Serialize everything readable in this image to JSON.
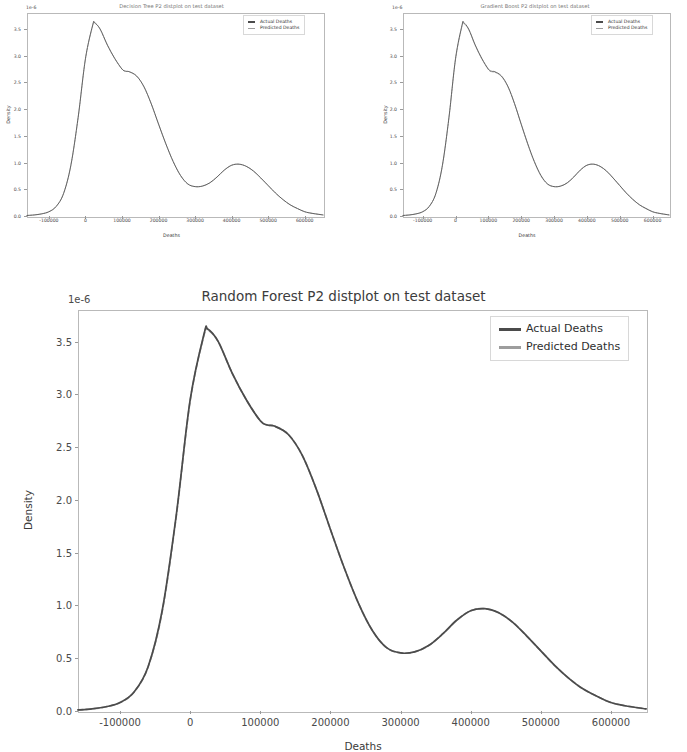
{
  "figure": {
    "background": "#ffffff",
    "panel_count": 3
  },
  "colors": {
    "actual": "#4b4b4b",
    "predicted": "#9d9d9d",
    "axis": "#b9b9b9",
    "text": "#3a3a3a"
  },
  "panels": [
    {
      "id": "decision-tree",
      "title": "Decision Tree P2 distplot on test dataset",
      "offset_text": "1e-6",
      "xlabel": "Deaths",
      "ylabel": "Density",
      "legend": [
        {
          "label": "Actual Deaths",
          "style": "solid"
        },
        {
          "label": "Predicted Deaths",
          "style": "dashed"
        }
      ]
    },
    {
      "id": "gradient-boost",
      "title": "Gradient Boost P2 distplot on test dataset",
      "offset_text": "1e-6",
      "xlabel": "Deaths",
      "ylabel": "Density",
      "legend": [
        {
          "label": "Actual Deaths",
          "style": "solid"
        },
        {
          "label": "Predicted Deaths",
          "style": "dashed"
        }
      ]
    },
    {
      "id": "random-forest",
      "title": "Random Forest P2 distplot on test dataset",
      "offset_text": "1e-6",
      "xlabel": "Deaths",
      "ylabel": "Density",
      "legend": [
        {
          "label": "Actual Deaths",
          "style": "solid"
        },
        {
          "label": "Predicted Deaths",
          "style": "dashed"
        }
      ]
    }
  ],
  "chart_data": [
    {
      "type": "line",
      "id": "decision-tree",
      "title": "Decision Tree P2 distplot on test dataset",
      "xlabel": "Deaths",
      "ylabel": "Density",
      "y_offset_text": "1e-6",
      "y_scale": 1e-06,
      "grid": false,
      "legend_position": "upper right",
      "xlim": [
        -160000,
        650000
      ],
      "ylim": [
        0.0,
        3.8
      ],
      "xticks": [
        -100000,
        0,
        100000,
        200000,
        300000,
        400000,
        500000,
        600000
      ],
      "xtick_labels": [
        "-100000",
        "0",
        "100000",
        "200000",
        "300000",
        "400000",
        "500000",
        "600000"
      ],
      "yticks": [
        0.0,
        0.5,
        1.0,
        1.5,
        2.0,
        2.5,
        3.0,
        3.5
      ],
      "ytick_labels": [
        "0.0",
        "0.5",
        "1.0",
        "1.5",
        "2.0",
        "2.5",
        "3.0",
        "3.5"
      ],
      "x": [
        -160000,
        -140000,
        -120000,
        -100000,
        -80000,
        -60000,
        -40000,
        -20000,
        0,
        20000,
        25000,
        40000,
        60000,
        80000,
        100000,
        110000,
        120000,
        140000,
        160000,
        180000,
        200000,
        220000,
        240000,
        260000,
        280000,
        300000,
        320000,
        340000,
        360000,
        380000,
        400000,
        420000,
        440000,
        460000,
        480000,
        500000,
        520000,
        540000,
        560000,
        580000,
        600000,
        620000,
        650000
      ],
      "series": [
        {
          "name": "Actual Deaths",
          "values": [
            0.01,
            0.02,
            0.04,
            0.08,
            0.18,
            0.42,
            0.95,
            1.85,
            2.95,
            3.58,
            3.62,
            3.5,
            3.2,
            2.95,
            2.75,
            2.71,
            2.7,
            2.62,
            2.42,
            2.1,
            1.72,
            1.35,
            1.02,
            0.76,
            0.6,
            0.55,
            0.56,
            0.62,
            0.73,
            0.86,
            0.95,
            0.97,
            0.93,
            0.84,
            0.71,
            0.57,
            0.43,
            0.31,
            0.21,
            0.14,
            0.08,
            0.05,
            0.02
          ]
        },
        {
          "name": "Predicted Deaths",
          "values": [
            0.01,
            0.02,
            0.04,
            0.08,
            0.18,
            0.42,
            0.94,
            1.84,
            2.94,
            3.57,
            3.61,
            3.5,
            3.2,
            2.95,
            2.75,
            2.71,
            2.7,
            2.62,
            2.42,
            2.1,
            1.72,
            1.35,
            1.02,
            0.76,
            0.6,
            0.55,
            0.56,
            0.62,
            0.73,
            0.86,
            0.95,
            0.97,
            0.93,
            0.84,
            0.71,
            0.57,
            0.43,
            0.31,
            0.21,
            0.14,
            0.08,
            0.05,
            0.02
          ]
        }
      ]
    },
    {
      "type": "line",
      "id": "gradient-boost",
      "title": "Gradient Boost P2 distplot on test dataset",
      "xlabel": "Deaths",
      "ylabel": "Density",
      "y_offset_text": "1e-6",
      "y_scale": 1e-06,
      "grid": false,
      "legend_position": "upper right",
      "xlim": [
        -160000,
        650000
      ],
      "ylim": [
        0.0,
        3.8
      ],
      "xticks": [
        -100000,
        0,
        100000,
        200000,
        300000,
        400000,
        500000,
        600000
      ],
      "xtick_labels": [
        "-100000",
        "0",
        "100000",
        "200000",
        "300000",
        "400000",
        "500000",
        "600000"
      ],
      "yticks": [
        0.0,
        0.5,
        1.0,
        1.5,
        2.0,
        2.5,
        3.0,
        3.5
      ],
      "ytick_labels": [
        "0.0",
        "0.5",
        "1.0",
        "1.5",
        "2.0",
        "2.5",
        "3.0",
        "3.5"
      ],
      "x": [
        -160000,
        -140000,
        -120000,
        -100000,
        -80000,
        -60000,
        -40000,
        -20000,
        0,
        20000,
        25000,
        40000,
        60000,
        80000,
        100000,
        110000,
        120000,
        140000,
        160000,
        180000,
        200000,
        220000,
        240000,
        260000,
        280000,
        300000,
        320000,
        340000,
        360000,
        380000,
        400000,
        420000,
        440000,
        460000,
        480000,
        500000,
        520000,
        540000,
        560000,
        580000,
        600000,
        620000,
        650000
      ],
      "series": [
        {
          "name": "Actual Deaths",
          "values": [
            0.01,
            0.02,
            0.04,
            0.08,
            0.18,
            0.42,
            0.95,
            1.85,
            2.95,
            3.58,
            3.62,
            3.5,
            3.2,
            2.95,
            2.75,
            2.71,
            2.7,
            2.62,
            2.42,
            2.1,
            1.72,
            1.35,
            1.02,
            0.76,
            0.6,
            0.55,
            0.56,
            0.62,
            0.73,
            0.86,
            0.95,
            0.97,
            0.93,
            0.84,
            0.71,
            0.57,
            0.43,
            0.31,
            0.21,
            0.14,
            0.08,
            0.05,
            0.02
          ]
        },
        {
          "name": "Predicted Deaths",
          "values": [
            0.01,
            0.02,
            0.04,
            0.08,
            0.18,
            0.42,
            0.94,
            1.84,
            2.93,
            3.56,
            3.6,
            3.49,
            3.19,
            2.94,
            2.74,
            2.7,
            2.69,
            2.61,
            2.41,
            2.09,
            1.71,
            1.34,
            1.01,
            0.75,
            0.6,
            0.55,
            0.56,
            0.62,
            0.73,
            0.86,
            0.95,
            0.97,
            0.93,
            0.84,
            0.71,
            0.57,
            0.43,
            0.31,
            0.21,
            0.14,
            0.08,
            0.05,
            0.02
          ]
        }
      ]
    },
    {
      "type": "line",
      "id": "random-forest",
      "title": "Random Forest P2 distplot on test dataset",
      "xlabel": "Deaths",
      "ylabel": "Density",
      "y_offset_text": "1e-6",
      "y_scale": 1e-06,
      "grid": false,
      "legend_position": "upper right",
      "xlim": [
        -160000,
        650000
      ],
      "ylim": [
        0.0,
        3.8
      ],
      "xticks": [
        -100000,
        0,
        100000,
        200000,
        300000,
        400000,
        500000,
        600000
      ],
      "xtick_labels": [
        "-100000",
        "0",
        "100000",
        "200000",
        "300000",
        "400000",
        "500000",
        "600000"
      ],
      "yticks": [
        0.0,
        0.5,
        1.0,
        1.5,
        2.0,
        2.5,
        3.0,
        3.5
      ],
      "ytick_labels": [
        "0.0",
        "0.5",
        "1.0",
        "1.5",
        "2.0",
        "2.5",
        "3.0",
        "3.5"
      ],
      "x": [
        -160000,
        -140000,
        -120000,
        -100000,
        -80000,
        -60000,
        -40000,
        -20000,
        0,
        20000,
        25000,
        40000,
        60000,
        80000,
        100000,
        110000,
        120000,
        140000,
        160000,
        180000,
        200000,
        220000,
        240000,
        260000,
        280000,
        300000,
        320000,
        340000,
        360000,
        380000,
        400000,
        420000,
        440000,
        460000,
        480000,
        500000,
        520000,
        540000,
        560000,
        580000,
        600000,
        620000,
        650000
      ],
      "series": [
        {
          "name": "Actual Deaths",
          "values": [
            0.01,
            0.02,
            0.04,
            0.08,
            0.18,
            0.42,
            0.95,
            1.85,
            2.95,
            3.58,
            3.62,
            3.5,
            3.2,
            2.95,
            2.75,
            2.71,
            2.7,
            2.62,
            2.42,
            2.1,
            1.72,
            1.35,
            1.02,
            0.76,
            0.6,
            0.55,
            0.56,
            0.62,
            0.73,
            0.86,
            0.95,
            0.97,
            0.93,
            0.84,
            0.71,
            0.57,
            0.43,
            0.31,
            0.21,
            0.14,
            0.08,
            0.05,
            0.02
          ]
        },
        {
          "name": "Predicted Deaths",
          "values": [
            0.01,
            0.02,
            0.04,
            0.08,
            0.18,
            0.42,
            0.94,
            1.84,
            2.94,
            3.57,
            3.61,
            3.5,
            3.2,
            2.95,
            2.75,
            2.71,
            2.7,
            2.62,
            2.42,
            2.1,
            1.72,
            1.35,
            1.02,
            0.76,
            0.6,
            0.55,
            0.56,
            0.62,
            0.73,
            0.86,
            0.95,
            0.97,
            0.93,
            0.84,
            0.71,
            0.57,
            0.43,
            0.31,
            0.21,
            0.14,
            0.08,
            0.05,
            0.02
          ]
        }
      ]
    }
  ]
}
